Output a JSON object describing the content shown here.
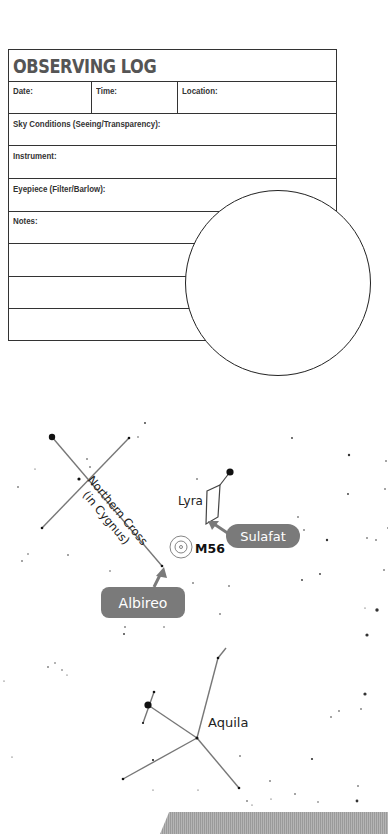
{
  "log": {
    "title": "OBSERVING LOG",
    "fields": {
      "date": "Date:",
      "time": "Time:",
      "location": "Location:",
      "sky": "Sky Conditions (Seeing/Transparency):",
      "instrument": "Instrument:",
      "eyepiece": "Eyepiece (Filter/Barlow):",
      "notes": "Notes:"
    }
  },
  "sketch_circle": {
    "label": "eyepiece-sketch-circle"
  },
  "starmap": {
    "labels": {
      "northern_cross": "Northern Cross",
      "in_cygnus": "(in Cygnus)",
      "lyra": "Lyra",
      "m56": "M56",
      "sulafat": "Sulafat",
      "albireo": "Albireo",
      "aquila": "Aquila"
    },
    "callout_color": "#7a7a7a",
    "line_color": "#777777"
  }
}
